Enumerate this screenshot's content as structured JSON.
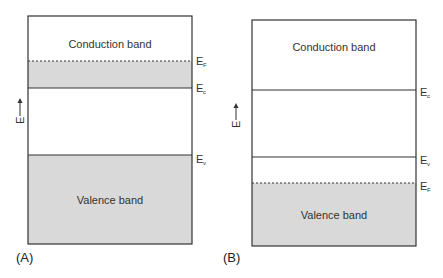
{
  "panels": [
    {
      "id": "A",
      "label": "(A)",
      "conduction_label": "Conduction band",
      "valence_label": "Valence band",
      "levels": [
        {
          "symbol": "E",
          "sub": "F",
          "style": "dashed"
        },
        {
          "symbol": "E",
          "sub": "c",
          "style": "solid"
        },
        {
          "symbol": "E",
          "sub": "v",
          "style": "solid"
        }
      ]
    },
    {
      "id": "B",
      "label": "(B)",
      "conduction_label": "Conduction band",
      "valence_label": "Valence band",
      "levels": [
        {
          "symbol": "E",
          "sub": "c",
          "style": "solid"
        },
        {
          "symbol": "E",
          "sub": "v",
          "style": "solid"
        },
        {
          "symbol": "E",
          "sub": "F",
          "style": "dashed"
        }
      ]
    }
  ],
  "axis": {
    "label": "E"
  },
  "colors": {
    "fill": "#d9d9d9",
    "line": "#333333"
  }
}
